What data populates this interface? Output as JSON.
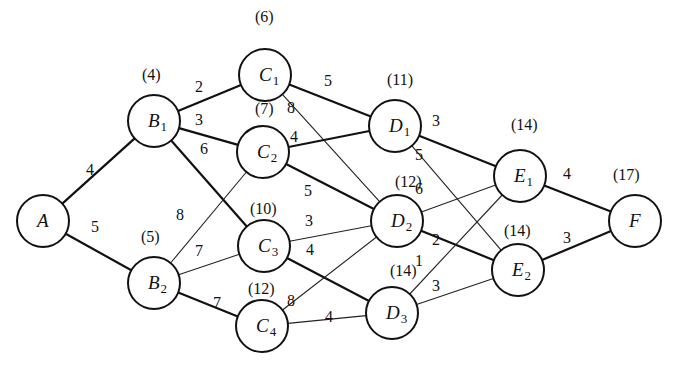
{
  "diagram": {
    "type": "weighted-directed-graph",
    "nodes": [
      {
        "id": "A",
        "letter": "A",
        "sub": "",
        "x": 43,
        "y": 221,
        "dist": ""
      },
      {
        "id": "B1",
        "letter": "B",
        "sub": "1",
        "x": 154,
        "y": 121,
        "dist": "(4)"
      },
      {
        "id": "B2",
        "letter": "B",
        "sub": "2",
        "x": 154,
        "y": 283,
        "dist": "(5)"
      },
      {
        "id": "C1",
        "letter": "C",
        "sub": "1",
        "x": 265,
        "y": 75,
        "dist": "(6)"
      },
      {
        "id": "C2",
        "letter": "C",
        "sub": "2",
        "x": 263,
        "y": 152,
        "dist": "(7)"
      },
      {
        "id": "C3",
        "letter": "C",
        "sub": "3",
        "x": 264,
        "y": 246,
        "dist": "(10)"
      },
      {
        "id": "C4",
        "letter": "C",
        "sub": "4",
        "x": 262,
        "y": 326,
        "dist": "(12)"
      },
      {
        "id": "D1",
        "letter": "D",
        "sub": "1",
        "x": 395,
        "y": 126,
        "dist": "(11)"
      },
      {
        "id": "D2",
        "letter": "D",
        "sub": "2",
        "x": 397,
        "y": 221,
        "dist": "(12)"
      },
      {
        "id": "D3",
        "letter": "D",
        "sub": "3",
        "x": 392,
        "y": 313,
        "dist": "(14)"
      },
      {
        "id": "E1",
        "letter": "E",
        "sub": "1",
        "x": 520,
        "y": 176,
        "dist": "(14)"
      },
      {
        "id": "E2",
        "letter": "E",
        "sub": "2",
        "x": 518,
        "y": 270,
        "dist": "(14)"
      },
      {
        "id": "F",
        "letter": "F",
        "sub": "",
        "x": 635,
        "y": 221,
        "dist": "(17)"
      }
    ],
    "dist_label_positions": {
      "B1": [
        142,
        80
      ],
      "B2": [
        141,
        242
      ],
      "C1": [
        255,
        22
      ],
      "C2": [
        255,
        114
      ],
      "C3": [
        250,
        214
      ],
      "C4": [
        248,
        294
      ],
      "D1": [
        387,
        85
      ],
      "D2": [
        395,
        187
      ],
      "D3": [
        390,
        276
      ],
      "E1": [
        511,
        130
      ],
      "E2": [
        504,
        236
      ],
      "F": [
        613,
        180
      ]
    },
    "edges": [
      {
        "from": "A",
        "to": "B1",
        "weight": "4",
        "style": "thick",
        "lx": 86,
        "ly": 175
      },
      {
        "from": "A",
        "to": "B2",
        "weight": "5",
        "style": "thick",
        "lx": 91,
        "ly": 232
      },
      {
        "from": "B1",
        "to": "C1",
        "weight": "2",
        "style": "thick",
        "lx": 195,
        "ly": 92
      },
      {
        "from": "B1",
        "to": "C2",
        "weight": "3",
        "style": "thick",
        "lx": 195,
        "ly": 125
      },
      {
        "from": "B1",
        "to": "C3",
        "weight": "6",
        "style": "thick",
        "lx": 200,
        "ly": 154
      },
      {
        "from": "B2",
        "to": "C2",
        "weight": "8",
        "style": "thin",
        "lx": 176,
        "ly": 220
      },
      {
        "from": "B2",
        "to": "C3",
        "weight": "7",
        "style": "thin",
        "lx": 195,
        "ly": 256
      },
      {
        "from": "B2",
        "to": "C4",
        "weight": "7",
        "style": "thick",
        "lx": 213,
        "ly": 308
      },
      {
        "from": "C1",
        "to": "D1",
        "weight": "5",
        "style": "thick",
        "lx": 324,
        "ly": 86
      },
      {
        "from": "C1",
        "to": "D2",
        "weight": "8",
        "style": "thin",
        "lx": 287,
        "ly": 113
      },
      {
        "from": "C2",
        "to": "D1",
        "weight": "4",
        "style": "thick",
        "lx": 290,
        "ly": 142
      },
      {
        "from": "C2",
        "to": "D2",
        "weight": "5",
        "style": "thick",
        "lx": 304,
        "ly": 196
      },
      {
        "from": "C3",
        "to": "D2",
        "weight": "3",
        "style": "thin",
        "lx": 305,
        "ly": 226
      },
      {
        "from": "C3",
        "to": "D3",
        "weight": "4",
        "style": "thick",
        "lx": 306,
        "ly": 255
      },
      {
        "from": "C4",
        "to": "D2",
        "weight": "8",
        "style": "thin",
        "lx": 287,
        "ly": 306
      },
      {
        "from": "C4",
        "to": "D3",
        "weight": "4",
        "style": "thin",
        "lx": 325,
        "ly": 322
      },
      {
        "from": "D1",
        "to": "E1",
        "weight": "3",
        "style": "thick",
        "lx": 432,
        "ly": 126
      },
      {
        "from": "D1",
        "to": "E2",
        "weight": "5",
        "style": "thin",
        "lx": 415,
        "ly": 160
      },
      {
        "from": "D2",
        "to": "E1",
        "weight": "6",
        "style": "thin",
        "lx": 415,
        "ly": 194
      },
      {
        "from": "D2",
        "to": "E2",
        "weight": "2",
        "style": "thick",
        "lx": 432,
        "ly": 245
      },
      {
        "from": "D3",
        "to": "E1",
        "weight": "1",
        "style": "thin",
        "lx": 415,
        "ly": 266
      },
      {
        "from": "D3",
        "to": "E2",
        "weight": "3",
        "style": "thin",
        "lx": 432,
        "ly": 291
      },
      {
        "from": "E1",
        "to": "F",
        "weight": "4",
        "style": "thick",
        "lx": 563,
        "ly": 179
      },
      {
        "from": "E2",
        "to": "F",
        "weight": "3",
        "style": "thick",
        "lx": 563,
        "ly": 243
      }
    ],
    "node_radius": 26,
    "colors": {
      "stroke": "#111111",
      "background": "#ffffff"
    }
  }
}
